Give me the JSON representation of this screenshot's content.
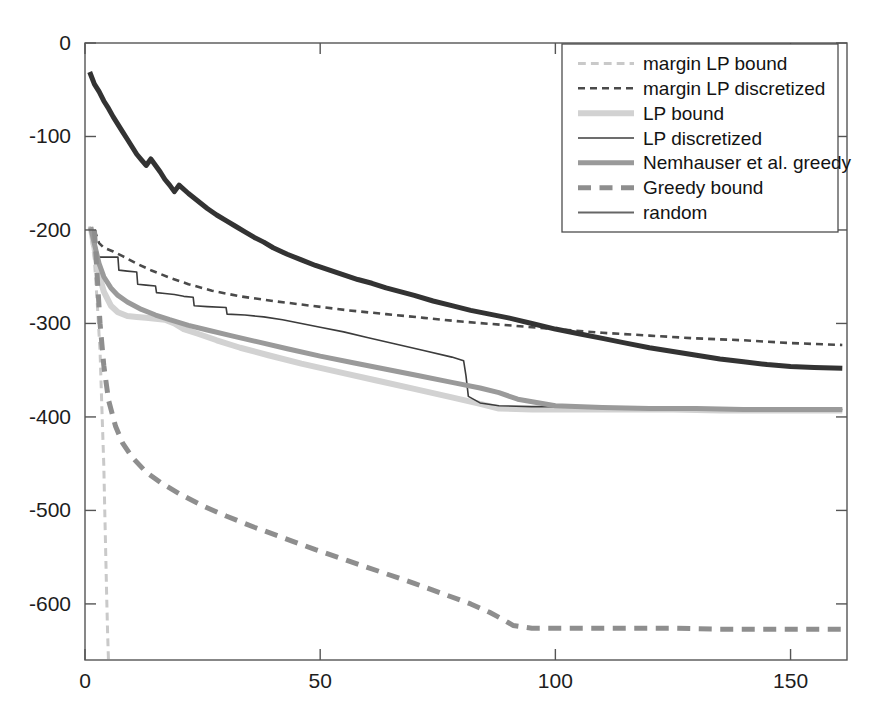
{
  "chart_data": {
    "type": "line",
    "title": "",
    "xlabel": "",
    "ylabel": "",
    "xlim": [
      0,
      162
    ],
    "ylim": [
      -660,
      0
    ],
    "grid": false,
    "legend_position": "top-right",
    "x_ticks": [
      "0",
      "50",
      "100",
      "150"
    ],
    "x_tick_values": [
      0,
      50,
      100,
      150
    ],
    "y_ticks": [
      "0",
      "-100",
      "-200",
      "-300",
      "-400",
      "-500",
      "-600"
    ],
    "y_tick_values": [
      0,
      -100,
      -200,
      -300,
      -400,
      -500,
      -600
    ],
    "series": [
      {
        "name": "margin LP bound",
        "style": "dashed",
        "color": "#c9c9c9",
        "width": 3,
        "x": [
          1,
          2,
          2.6,
          3.2,
          3.6,
          4,
          4.2,
          4.4,
          4.6,
          4.8,
          5
        ],
        "values": [
          -196,
          -232,
          -278,
          -330,
          -392,
          -452,
          -500,
          -545,
          -590,
          -630,
          -662
        ]
      },
      {
        "name": "margin LP discretized",
        "style": "dashed",
        "color": "#4a4a4a",
        "width": 2.6,
        "x": [
          2,
          3,
          4,
          6,
          8,
          11,
          14,
          18,
          22,
          27,
          33,
          40,
          48,
          56,
          64,
          72,
          80,
          90,
          100,
          110,
          120,
          130,
          140,
          150,
          161
        ],
        "values": [
          -200,
          -214,
          -219,
          -223,
          -228,
          -236,
          -243,
          -251,
          -258,
          -265,
          -271,
          -276,
          -281,
          -286,
          -290,
          -294,
          -298,
          -302,
          -306,
          -310,
          -313,
          -316,
          -318,
          -321,
          -323
        ]
      },
      {
        "name": "LP bound",
        "style": "solid",
        "color": "#d2d2d2",
        "width": 6,
        "x": [
          1.2,
          2,
          3,
          4,
          5.5,
          7,
          9,
          11,
          13,
          15,
          17,
          19,
          21,
          24,
          28,
          33,
          39,
          46,
          54,
          62,
          70,
          78,
          84,
          88,
          95,
          105,
          115,
          125,
          135,
          145,
          155,
          161
        ],
        "values": [
          -197,
          -219,
          -248,
          -266,
          -281,
          -288,
          -292,
          -293,
          -294,
          -295,
          -296,
          -300,
          -306,
          -311,
          -318,
          -326,
          -334,
          -343,
          -352,
          -361,
          -370,
          -379,
          -386,
          -391,
          -392,
          -392,
          -392,
          -392,
          -393,
          -393,
          -393,
          -393
        ]
      },
      {
        "name": "LP discretized",
        "style": "solid",
        "color": "#3c3c3c",
        "width": 1.6,
        "x": [
          2,
          2.6,
          3,
          5,
          7,
          7.2,
          9,
          11,
          11.2,
          13,
          15,
          15.2,
          17,
          19,
          21,
          23,
          23.2,
          26,
          30,
          30.2,
          34,
          38,
          42,
          46,
          50,
          55,
          60,
          66,
          72,
          78,
          80.5,
          81,
          81.5,
          84,
          88,
          95,
          105,
          115,
          125,
          135,
          145,
          155,
          161
        ],
        "values": [
          -200,
          -228,
          -229,
          -229,
          -229,
          -243,
          -244,
          -245,
          -258,
          -259,
          -260,
          -267,
          -268,
          -269,
          -271,
          -272,
          -281,
          -282,
          -283,
          -290,
          -291,
          -293,
          -296,
          -300,
          -304,
          -309,
          -315,
          -322,
          -329,
          -336,
          -340,
          -356,
          -378,
          -385,
          -388,
          -389,
          -389,
          -390,
          -390,
          -391,
          -391,
          -392,
          -392
        ]
      },
      {
        "name": "Nemhauser et al. greedy",
        "style": "solid",
        "color": "#9a9a9a",
        "width": 5,
        "x": [
          1.2,
          2,
          3,
          4,
          5.5,
          7,
          9,
          12,
          15,
          18,
          22,
          26,
          31,
          37,
          43,
          50,
          57,
          64,
          71,
          78,
          84,
          88,
          92,
          100,
          110,
          120,
          130,
          140,
          150,
          161
        ],
        "values": [
          -197,
          -215,
          -236,
          -250,
          -262,
          -270,
          -277,
          -285,
          -291,
          -296,
          -302,
          -307,
          -313,
          -320,
          -327,
          -335,
          -342,
          -349,
          -356,
          -363,
          -369,
          -374,
          -381,
          -388,
          -390,
          -391,
          -391,
          -392,
          -392,
          -392
        ]
      },
      {
        "name": "Greedy bound",
        "style": "dashed",
        "color": "#8e8e8e",
        "width": 5,
        "x": [
          2,
          2.6,
          3.2,
          4,
          5,
          6.5,
          8,
          10,
          13,
          16,
          20,
          25,
          30,
          36,
          42,
          49,
          56,
          63,
          70,
          76,
          82,
          86,
          89,
          91,
          95,
          105,
          115,
          125,
          135,
          145,
          155,
          161
        ],
        "values": [
          -200,
          -250,
          -300,
          -345,
          -382,
          -410,
          -428,
          -443,
          -459,
          -470,
          -482,
          -495,
          -506,
          -518,
          -529,
          -542,
          -554,
          -566,
          -578,
          -589,
          -600,
          -609,
          -617,
          -623,
          -626,
          -626,
          -626,
          -626,
          -627,
          -627,
          -627,
          -627
        ]
      },
      {
        "name": "random",
        "style": "solid",
        "color": "#333333",
        "width": 5,
        "x": [
          1,
          2,
          3,
          4,
          5,
          6,
          7,
          8,
          9,
          10,
          11,
          12,
          13,
          14,
          15,
          16,
          17,
          18,
          19,
          20,
          22,
          24,
          26,
          28,
          30,
          32,
          34,
          36,
          38,
          40,
          43,
          46,
          49,
          52,
          55,
          58,
          61,
          64,
          67,
          70,
          74,
          78,
          82,
          86,
          90,
          95,
          100,
          105,
          110,
          115,
          120,
          125,
          130,
          135,
          140,
          145,
          150,
          155,
          161
        ],
        "values": [
          -31,
          -44,
          -52,
          -62,
          -70,
          -79,
          -87,
          -95,
          -103,
          -111,
          -119,
          -125,
          -131,
          -124,
          -131,
          -138,
          -146,
          -152,
          -159,
          -152,
          -161,
          -169,
          -177,
          -184,
          -190,
          -196,
          -202,
          -208,
          -213,
          -219,
          -226,
          -232,
          -238,
          -243,
          -248,
          -253,
          -257,
          -262,
          -266,
          -270,
          -276,
          -281,
          -286,
          -290,
          -294,
          -300,
          -306,
          -311,
          -316,
          -321,
          -326,
          -330,
          -334,
          -338,
          -341,
          -344,
          -346,
          -347,
          -348
        ]
      }
    ]
  },
  "legend": {
    "entries": [
      {
        "label": "margin LP bound",
        "style": "dashed",
        "color": "#c9c9c9",
        "width": 3
      },
      {
        "label": "margin LP discretized",
        "style": "dashed",
        "color": "#4a4a4a",
        "width": 2.6
      },
      {
        "label": "LP bound",
        "style": "solid",
        "color": "#d2d2d2",
        "width": 6
      },
      {
        "label": "LP discretized",
        "style": "solid",
        "color": "#3c3c3c",
        "width": 1.6
      },
      {
        "label": "Nemhauser et al. greedy",
        "style": "solid",
        "color": "#9a9a9a",
        "width": 5
      },
      {
        "label": "Greedy bound",
        "style": "dashed",
        "color": "#8e8e8e",
        "width": 5
      },
      {
        "label": "random",
        "style": "solid",
        "color": "#666666",
        "width": 2
      }
    ]
  },
  "axes": {
    "frame_color": "#555555",
    "tick_color": "#555555",
    "label_color": "#1d1d1d"
  }
}
